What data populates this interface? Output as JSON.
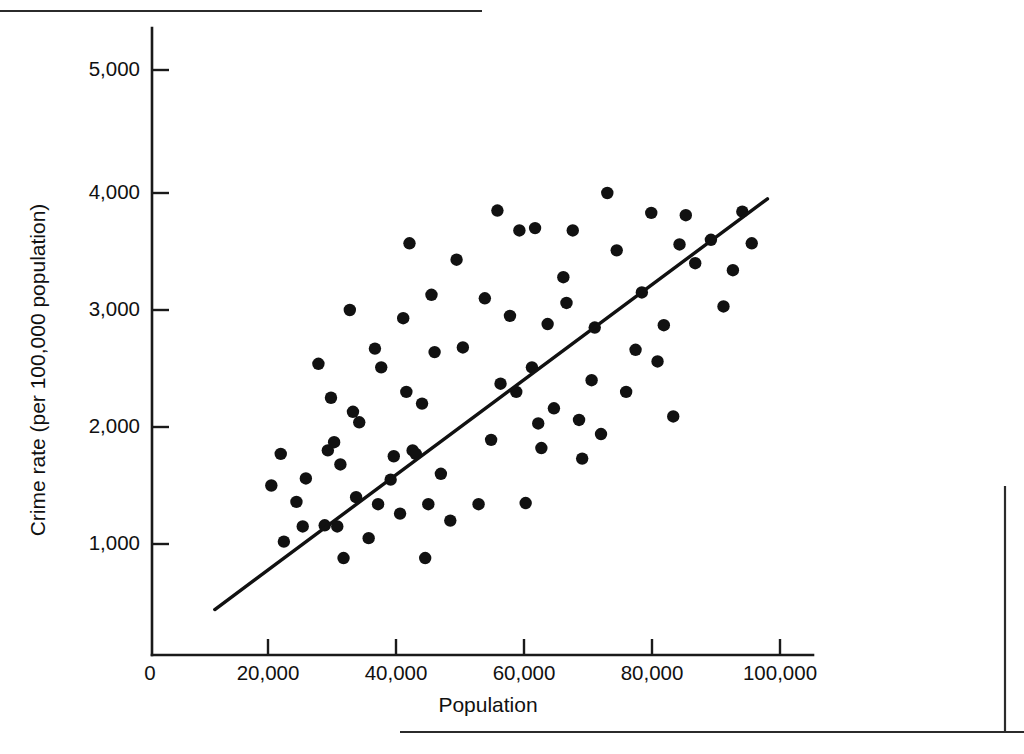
{
  "figure": {
    "kind": "scatter-plot-with-regression-line",
    "background_color": "#ffffff",
    "ink_color": "#111111"
  },
  "rules": {
    "top_rule_label": "top-page-rule",
    "right_rule_label": "right-page-rule",
    "bottom_rule_label": "bottom-page-rule"
  },
  "axes": {
    "x_title": "Population",
    "y_title": "Crime rate (per 100,000 population)",
    "x_tick_labels": [
      "0",
      "20,000",
      "40,000",
      "60,000",
      "80,000",
      "100,000"
    ],
    "y_tick_labels": [
      "1,000",
      "2,000",
      "3,000",
      "4,000",
      "5,000"
    ]
  },
  "chart_data": {
    "type": "scatter",
    "title": "",
    "xlabel": "Population",
    "ylabel": "Crime rate (per 100,000 population)",
    "xlim": [
      0,
      102000
    ],
    "ylim": [
      0,
      5400
    ],
    "xticks": [
      0,
      20000,
      40000,
      60000,
      80000,
      100000
    ],
    "yticks": [
      1000,
      2000,
      3000,
      4000,
      5000
    ],
    "xtick_labels": [
      "0",
      "20,000",
      "40,000",
      "60,000",
      "80,000",
      "100,000"
    ],
    "ytick_labels": [
      "1,000",
      "2,000",
      "3,000",
      "4,000",
      "5,000"
    ],
    "grid": false,
    "legend": null,
    "marker": "filled-circle",
    "marker_color": "#111111",
    "marker_size_px": 6.2,
    "points": [
      [
        19000,
        1500
      ],
      [
        20500,
        1770
      ],
      [
        21000,
        1020
      ],
      [
        23000,
        1360
      ],
      [
        24000,
        1150
      ],
      [
        24500,
        1560
      ],
      [
        26500,
        2540
      ],
      [
        27500,
        1160
      ],
      [
        28000,
        1800
      ],
      [
        28500,
        2250
      ],
      [
        29000,
        1870
      ],
      [
        29500,
        1150
      ],
      [
        30000,
        1680
      ],
      [
        30500,
        880
      ],
      [
        31500,
        3000
      ],
      [
        32000,
        2130
      ],
      [
        32500,
        1400
      ],
      [
        33000,
        2040
      ],
      [
        34500,
        1050
      ],
      [
        35500,
        2670
      ],
      [
        36000,
        1340
      ],
      [
        36500,
        2510
      ],
      [
        38000,
        1550
      ],
      [
        38500,
        1750
      ],
      [
        39500,
        1260
      ],
      [
        40000,
        2930
      ],
      [
        40500,
        2300
      ],
      [
        41000,
        3570
      ],
      [
        41500,
        1800
      ],
      [
        42000,
        1770
      ],
      [
        43000,
        2200
      ],
      [
        43500,
        880
      ],
      [
        44000,
        1340
      ],
      [
        44500,
        3130
      ],
      [
        45000,
        2640
      ],
      [
        46000,
        1600
      ],
      [
        47500,
        1200
      ],
      [
        48500,
        3430
      ],
      [
        49500,
        2680
      ],
      [
        52000,
        1340
      ],
      [
        53000,
        3100
      ],
      [
        54000,
        1890
      ],
      [
        55000,
        3850
      ],
      [
        55500,
        2370
      ],
      [
        57000,
        2950
      ],
      [
        58000,
        2300
      ],
      [
        58500,
        3680
      ],
      [
        59500,
        1350
      ],
      [
        60500,
        2510
      ],
      [
        61000,
        3700
      ],
      [
        61500,
        2030
      ],
      [
        62000,
        1820
      ],
      [
        63000,
        2880
      ],
      [
        64000,
        2160
      ],
      [
        65500,
        3280
      ],
      [
        66000,
        3060
      ],
      [
        67000,
        3680
      ],
      [
        68000,
        2060
      ],
      [
        68500,
        1730
      ],
      [
        70000,
        2400
      ],
      [
        70500,
        2850
      ],
      [
        71500,
        1940
      ],
      [
        72500,
        4000
      ],
      [
        74000,
        3510
      ],
      [
        75500,
        2300
      ],
      [
        77000,
        2660
      ],
      [
        78000,
        3150
      ],
      [
        79500,
        3830
      ],
      [
        80500,
        2560
      ],
      [
        81500,
        2870
      ],
      [
        83000,
        2090
      ],
      [
        84000,
        3560
      ],
      [
        85000,
        3810
      ],
      [
        86500,
        3400
      ],
      [
        89000,
        3600
      ],
      [
        91000,
        3030
      ],
      [
        92500,
        3340
      ],
      [
        94000,
        3840
      ],
      [
        95500,
        3570
      ]
    ],
    "trend_line": {
      "label": "least-squares regression line",
      "x_start": 10000,
      "y_start": 440,
      "x_end": 98000,
      "y_end": 3950
    }
  }
}
